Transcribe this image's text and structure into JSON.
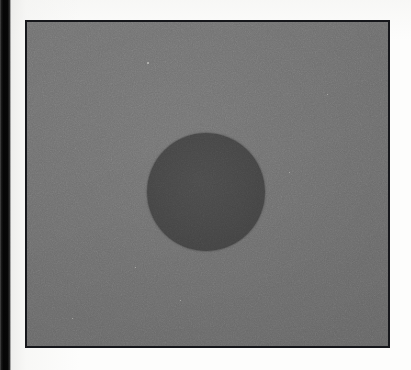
{
  "document": {
    "kind": "scanned-figure",
    "page_background": "#fdfdfc",
    "caption": "",
    "label": ""
  },
  "gutter": {
    "name": "book-gutter-shadow",
    "color": "#050505",
    "x": 0,
    "width": 11,
    "height": 370
  },
  "figure": {
    "title": "",
    "border_color": "#15161a",
    "border_width": 2,
    "background_color": "#6b6b6b",
    "x": 25,
    "y": 20,
    "width": 365,
    "height": 328
  },
  "chart_data": {
    "type": "scatter",
    "title": "",
    "subtitle": "",
    "xlabel": "",
    "ylabel": "",
    "grid": false,
    "legend_position": "none",
    "axis_visible": false,
    "tick_labels": [],
    "annotations": [],
    "background_value": 107,
    "background_color": "#6b6b6b",
    "series": [
      {
        "name": "dark disc",
        "marker": "filled-circle",
        "color": "#434343",
        "value": 67,
        "points": [
          {
            "x": 204,
            "y": 190,
            "diameter": 118,
            "radius": 59,
            "fill": "#434343"
          }
        ]
      }
    ]
  },
  "specks": [
    {
      "x": 120,
      "y": 40,
      "size": 1.5
    },
    {
      "x": 300,
      "y": 72,
      "size": 1.2
    },
    {
      "x": 108,
      "y": 245,
      "size": 1.4
    },
    {
      "x": 45,
      "y": 296,
      "size": 1.3
    },
    {
      "x": 153,
      "y": 278,
      "size": 1.1
    },
    {
      "x": 312,
      "y": 325,
      "size": 1.6
    },
    {
      "x": 262,
      "y": 150,
      "size": 1.0
    }
  ]
}
